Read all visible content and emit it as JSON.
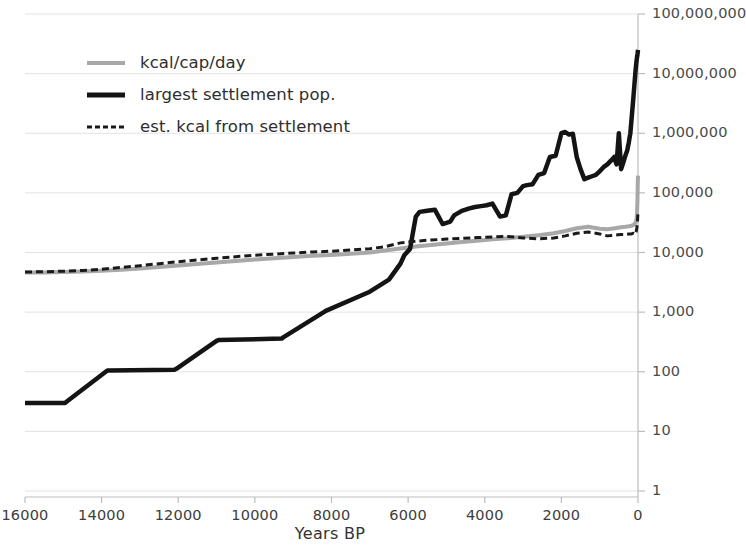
{
  "chart_data": {
    "type": "line",
    "title": "",
    "xlabel": "Years BP",
    "ylabel": "",
    "x_reversed": true,
    "xlim": [
      16000,
      0
    ],
    "ylim": [
      1,
      100000000
    ],
    "yscale": "log",
    "grid": true,
    "legend_position": "upper-left",
    "x_ticks": [
      "16000",
      "14000",
      "12000",
      "10000",
      "8000",
      "6000",
      "4000",
      "2000",
      "0"
    ],
    "x_tick_values": [
      16000,
      14000,
      12000,
      10000,
      8000,
      6000,
      4000,
      2000,
      0
    ],
    "y_ticks": [
      "100,000,000",
      "10,000,000",
      "1,000,000",
      "100,000",
      "10,000",
      "1,000",
      "100",
      "10",
      "1"
    ],
    "y_tick_values": [
      100000000,
      10000000,
      1000000,
      100000,
      10000,
      1000,
      100,
      10,
      1
    ],
    "colors": {
      "kcal_per_cap_day": "#a8a8a8",
      "largest_settlement_pop": "#141414",
      "est_kcal_from_settlement": "#1a1a1a",
      "gridline": "#e2e2e2",
      "axis": "#bdbdbd",
      "text": "#3b3b3b"
    },
    "series": [
      {
        "name": "kcal/cap/day",
        "style": "solid",
        "color": "#a8a8a8",
        "width": 4,
        "x": [
          16000,
          15500,
          15000,
          14500,
          14000,
          13500,
          13000,
          12500,
          12000,
          11500,
          11000,
          10500,
          10000,
          9500,
          9000,
          8500,
          8000,
          7500,
          7000,
          6600,
          6200,
          5800,
          5400,
          5000,
          4600,
          4200,
          3800,
          3400,
          3000,
          2600,
          2200,
          1900,
          1600,
          1300,
          1000,
          800,
          600,
          450,
          330,
          240,
          170,
          120,
          80,
          50,
          30,
          15,
          5,
          0
        ],
        "y": [
          4600,
          4640,
          4700,
          4800,
          4950,
          5150,
          5400,
          5700,
          6050,
          6400,
          6800,
          7200,
          7600,
          8000,
          8400,
          8800,
          9100,
          9500,
          10000,
          10800,
          11700,
          12600,
          13400,
          14200,
          15000,
          15800,
          16600,
          17400,
          18300,
          19500,
          21000,
          23000,
          25500,
          27000,
          25000,
          24500,
          25500,
          26500,
          27000,
          27500,
          28000,
          29000,
          30500,
          33000,
          40000,
          70000,
          150000,
          195000
        ]
      },
      {
        "name": "largest settlement pop.",
        "style": "solid",
        "color": "#141414",
        "width": 4.5,
        "x": [
          16000,
          14950,
          14900,
          13850,
          13800,
          12100,
          12050,
          11000,
          10950,
          9300,
          9250,
          8200,
          8150,
          7000,
          6500,
          6200,
          6100,
          5950,
          5800,
          5700,
          5500,
          5300,
          5100,
          4900,
          4800,
          4600,
          4400,
          4250,
          4100,
          3950,
          3800,
          3600,
          3450,
          3300,
          3150,
          3000,
          2900,
          2750,
          2600,
          2450,
          2300,
          2150,
          2000,
          1900,
          1800,
          1700,
          1600,
          1500,
          1400,
          1300,
          1200,
          1100,
          1000,
          900,
          800,
          700,
          620,
          560,
          500,
          440,
          380,
          330,
          280,
          240,
          200,
          160,
          120,
          90,
          65,
          45,
          30,
          18,
          10,
          4,
          0
        ],
        "y": [
          30,
          30,
          32,
          105,
          105,
          108,
          112,
          330,
          340,
          360,
          380,
          1000,
          1050,
          2200,
          3500,
          6500,
          9000,
          11500,
          40000,
          48000,
          50000,
          52000,
          30000,
          33000,
          42000,
          50000,
          55000,
          58000,
          60000,
          62000,
          66000,
          40000,
          42000,
          95000,
          100000,
          130000,
          135000,
          140000,
          200000,
          215000,
          400000,
          420000,
          1000000,
          1050000,
          950000,
          980000,
          400000,
          250000,
          170000,
          180000,
          190000,
          200000,
          230000,
          270000,
          300000,
          350000,
          400000,
          300000,
          1000000,
          250000,
          330000,
          420000,
          520000,
          700000,
          1000000,
          2000000,
          4000000,
          7000000,
          11000000,
          15000000,
          18000000,
          20000000,
          22000000,
          24000000,
          25000000
        ]
      },
      {
        "name": "est. kcal from settlement",
        "style": "dashed",
        "color": "#1a1a1a",
        "width": 3,
        "x": [
          16000,
          15500,
          15000,
          14500,
          14000,
          13500,
          13000,
          12500,
          12000,
          11500,
          11000,
          10500,
          10000,
          9500,
          9000,
          8500,
          8000,
          7500,
          7000,
          6600,
          6200,
          5800,
          5400,
          5000,
          4600,
          4200,
          3800,
          3400,
          3000,
          2600,
          2200,
          1900,
          1600,
          1300,
          1000,
          800,
          600,
          450,
          330,
          240,
          170,
          120,
          80,
          50,
          30,
          15,
          5,
          0
        ],
        "y": [
          4700,
          4760,
          4850,
          5000,
          5250,
          5600,
          6000,
          6500,
          7000,
          7500,
          8000,
          8500,
          9000,
          9400,
          9800,
          10200,
          10500,
          11000,
          11600,
          12500,
          14500,
          15500,
          16200,
          16800,
          17300,
          17800,
          18200,
          18600,
          17500,
          17000,
          17500,
          19000,
          21000,
          22000,
          20500,
          19000,
          19500,
          20000,
          20000,
          20500,
          20500,
          21000,
          20000,
          22000,
          26000,
          32000,
          42000,
          48000
        ]
      }
    ]
  },
  "legend": {
    "items": [
      {
        "label": "kcal/cap/day",
        "style": "solid",
        "color": "#a8a8a8"
      },
      {
        "label": "largest settlement pop.",
        "style": "solid",
        "color": "#141414"
      },
      {
        "label": "est. kcal from settlement",
        "style": "dashed",
        "color": "#1a1a1a"
      }
    ]
  }
}
